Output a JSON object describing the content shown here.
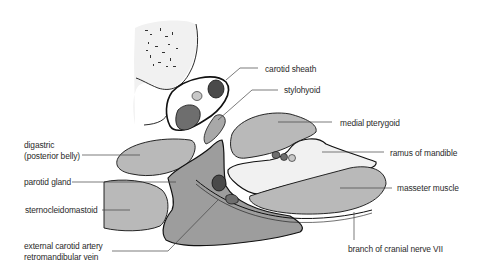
{
  "diagram": {
    "colors": {
      "background": "#ffffff",
      "outline": "#111111",
      "muscle_fill": "#b9b9b9",
      "gland_fill": "#9d9d9d",
      "bone_fill": "#f1f1f1",
      "vessel_dark": "#4a4a4a",
      "vessel_mid": "#6e6e6e",
      "vessel_light": "#c8c8c8",
      "leader_line": "#444444",
      "label_text": "#2a2a2a"
    },
    "labels": {
      "carotid_sheath": "carotid sheath",
      "stylohyoid": "stylohyoid",
      "medial_pterygoid": "medial pterygoid",
      "digastric_line1": "digastric",
      "digastric_line2": "(posterior belly)",
      "ramus_of_mandible": "ramus of mandible",
      "parotid_gland": "parotid gland",
      "masseter_muscle": "masseter muscle",
      "sternocleidomastoid": "sternocleidomastoid",
      "external_carotid_artery": "external carotid artery",
      "retromandibular_vein": "retromandibular vein",
      "branch_of_cranial_nerve_vii": "branch of cranial nerve VII"
    }
  }
}
